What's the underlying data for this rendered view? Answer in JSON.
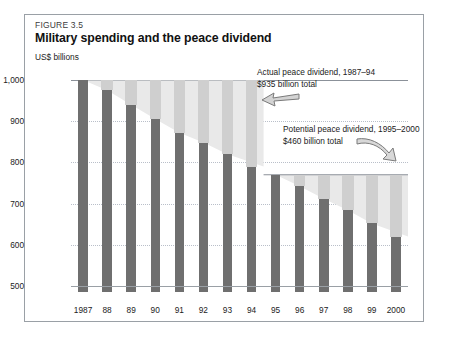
{
  "figure": {
    "label": "FIGURE 3.5",
    "title": "Military spending and the peace dividend",
    "unit_label": "US$ billions"
  },
  "annotations": [
    {
      "name": "actual-peace-dividend",
      "line1": "Actual peace dividend, 1987–94",
      "line2": "$935 billion total",
      "arrow": "arrow-left-icon"
    },
    {
      "name": "potential-peace-dividend",
      "line1": "Potential peace dividend, 1995–2000",
      "line2": "$460 billion total",
      "arrow": "arrow-right-down-icon"
    }
  ],
  "chart_data": {
    "type": "bar",
    "title": "Military spending and the peace dividend",
    "xlabel": "",
    "ylabel": "US$ billions",
    "ylim": [
      500,
      1000
    ],
    "yticks": [
      500,
      600,
      700,
      800,
      900,
      1000
    ],
    "ytick_labels": [
      "500",
      "600",
      "700",
      "800",
      "900",
      "1,000"
    ],
    "grid": true,
    "legend": "none",
    "categories": [
      "1987",
      "88",
      "89",
      "90",
      "91",
      "92",
      "93",
      "94",
      "95",
      "96",
      "97",
      "98",
      "99",
      "2000"
    ],
    "values": [
      1000,
      975,
      940,
      905,
      872,
      848,
      820,
      790,
      770,
      742,
      712,
      684,
      652,
      620
    ],
    "series": [
      {
        "name": "Military spending",
        "values": [
          1000,
          975,
          940,
          905,
          872,
          848,
          820,
          790,
          770,
          742,
          712,
          684,
          652,
          620
        ]
      }
    ],
    "reference_lines": [
      {
        "name": "actual-dividend-baseline",
        "value": 1000,
        "from": "1987",
        "to": "94"
      },
      {
        "name": "potential-dividend-baseline",
        "value": 770,
        "from": "95",
        "to": "2000"
      }
    ],
    "shaded_regions": [
      {
        "name": "actual-peace-dividend-area",
        "from": "1987",
        "to": "94",
        "top": 1000,
        "total": "$935 billion total"
      },
      {
        "name": "potential-peace-dividend-area",
        "from": "95",
        "to": "2000",
        "top": 770,
        "total": "$460 billion total"
      }
    ],
    "colors": {
      "bar": "#6f6f6f",
      "band": "#cfcfcf",
      "wedge": "#e9e9e9",
      "grid": "#b9bfc9",
      "axis": "#8b9199"
    }
  }
}
